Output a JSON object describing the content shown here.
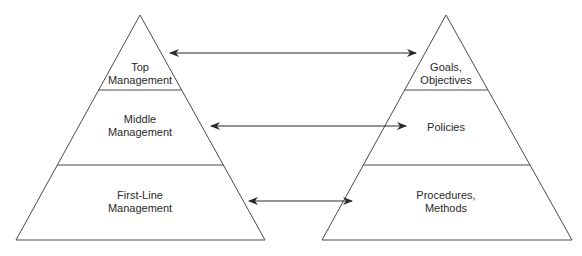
{
  "diagram": {
    "left_pyramid": {
      "name": "Management levels",
      "levels": [
        {
          "line1": "Top",
          "line2": "Management"
        },
        {
          "line1": "Middle",
          "line2": "Management"
        },
        {
          "line1": "First-Line",
          "line2": "Management"
        }
      ]
    },
    "right_pyramid": {
      "name": "Planning types",
      "levels": [
        {
          "line1": "Goals,",
          "line2": "Objectives"
        },
        {
          "line1": "Policies",
          "line2": ""
        },
        {
          "line1": "Procedures,",
          "line2": "Methods"
        }
      ]
    },
    "arrows": [
      {
        "from": "Top Management",
        "to": "Goals, Objectives",
        "type": "bidirectional"
      },
      {
        "from": "Middle Management",
        "to": "Policies",
        "type": "bidirectional"
      },
      {
        "from": "First-Line Management",
        "to": "Procedures, Methods",
        "type": "bidirectional"
      }
    ],
    "colors": {
      "stroke": "#3a3a3a",
      "text": "#2a2a2a",
      "background": "#ffffff"
    }
  }
}
